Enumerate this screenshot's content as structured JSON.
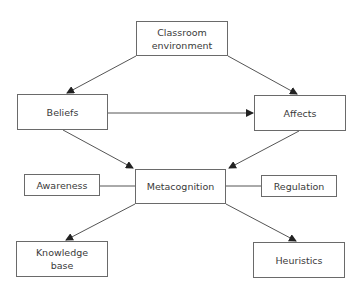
{
  "diagram": {
    "nodes": [
      {
        "id": "classroom",
        "label": "Classroom\nenvironment"
      },
      {
        "id": "beliefs",
        "label": "Beliefs"
      },
      {
        "id": "affects",
        "label": "Affects"
      },
      {
        "id": "metacognition",
        "label": "Metacognition"
      },
      {
        "id": "awareness",
        "label": "Awareness"
      },
      {
        "id": "regulation",
        "label": "Regulation"
      },
      {
        "id": "knowledge",
        "label": "Knowledge\nbase"
      },
      {
        "id": "heuristics",
        "label": "Heuristics"
      }
    ],
    "edges": [
      {
        "from": "classroom",
        "to": "beliefs",
        "arrow": true
      },
      {
        "from": "classroom",
        "to": "affects",
        "arrow": true
      },
      {
        "from": "beliefs",
        "to": "affects",
        "arrow": true
      },
      {
        "from": "beliefs",
        "to": "metacognition",
        "arrow": true
      },
      {
        "from": "affects",
        "to": "metacognition",
        "arrow": true
      },
      {
        "from": "awareness",
        "to": "metacognition",
        "arrow": false
      },
      {
        "from": "regulation",
        "to": "metacognition",
        "arrow": false
      },
      {
        "from": "metacognition",
        "to": "knowledge",
        "arrow": true
      },
      {
        "from": "metacognition",
        "to": "heuristics",
        "arrow": true
      }
    ],
    "colors": {
      "line": "#555555",
      "box_border": "#6a6a6a",
      "text": "#3a3a3a"
    }
  }
}
